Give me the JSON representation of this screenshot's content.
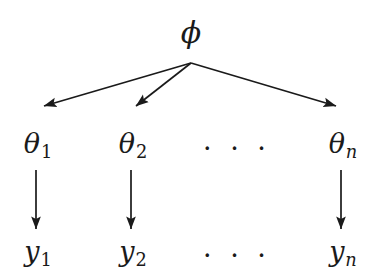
{
  "diagram": {
    "background_color": "#ffffff",
    "stroke_color": "#1a1a1a",
    "root": {
      "symbol": "ϕ",
      "name": "phi"
    },
    "levels": {
      "theta_row_label": "theta",
      "y_row_label": "y"
    },
    "theta_nodes": [
      {
        "symbol": "θ",
        "subscript": "1",
        "subscript_kind": "digit"
      },
      {
        "symbol": "θ",
        "subscript": "2",
        "subscript_kind": "digit"
      },
      {
        "symbol": "θ",
        "subscript": "n",
        "subscript_kind": "letter"
      }
    ],
    "y_nodes": [
      {
        "symbol": "y",
        "subscript": "1",
        "subscript_kind": "digit"
      },
      {
        "symbol": "y",
        "subscript": "2",
        "subscript_kind": "digit"
      },
      {
        "symbol": "y",
        "subscript": "n",
        "subscript_kind": "letter"
      }
    ],
    "ellipsis_theta": "· · ·",
    "ellipsis_y": "· · ·"
  }
}
